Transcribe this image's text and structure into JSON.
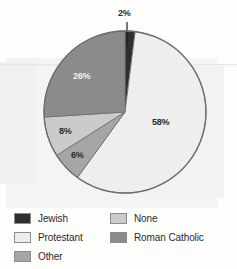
{
  "chart_data": {
    "type": "pie",
    "title": "",
    "categories": [
      "Jewish",
      "Protestant",
      "Other",
      "None",
      "Roman Catholic"
    ],
    "values": [
      2,
      58,
      6,
      8,
      26
    ],
    "labels": [
      "2%",
      "58%",
      "6%",
      "8%",
      "26%"
    ],
    "units": "percent",
    "total": 100,
    "legend_position": "bottom",
    "grid": false,
    "start_angle_deg": 0,
    "direction": "clockwise",
    "colors": {
      "jewish": "#2e2e2e",
      "protestant": "#eeeeec",
      "other": "#a6a6a6",
      "none": "#cbcbcb",
      "roman_catholic": "#8b8b8b",
      "outline": "#6f6f6f",
      "label_dark": "#2b2b2b",
      "label_light": "#f2f2f2"
    },
    "slices": [
      {
        "name": "Jewish",
        "value": 2,
        "label": "2%",
        "color": "#2e2e2e",
        "label_color": "dark",
        "leader_line": true
      },
      {
        "name": "Protestant",
        "value": 58,
        "label": "58%",
        "color": "#eeeeec",
        "label_color": "dark",
        "leader_line": false
      },
      {
        "name": "Other",
        "value": 6,
        "label": "6%",
        "color": "#a6a6a6",
        "label_color": "dark",
        "leader_line": false
      },
      {
        "name": "None",
        "value": 8,
        "label": "8%",
        "color": "#cbcbcb",
        "label_color": "dark",
        "leader_line": false
      },
      {
        "name": "Roman Catholic",
        "value": 26,
        "label": "26%",
        "color": "#8b8b8b",
        "label_color": "light",
        "leader_line": false
      }
    ]
  },
  "legend": {
    "left_column": [
      {
        "label": "Jewish",
        "color": "#2e2e2e"
      },
      {
        "label": "Protestant",
        "color": "#eeeeec"
      },
      {
        "label": "Other",
        "color": "#a6a6a6"
      }
    ],
    "right_column": [
      {
        "label": "None",
        "color": "#cbcbcb"
      },
      {
        "label": "Roman Catholic",
        "color": "#8b8b8b"
      }
    ]
  }
}
